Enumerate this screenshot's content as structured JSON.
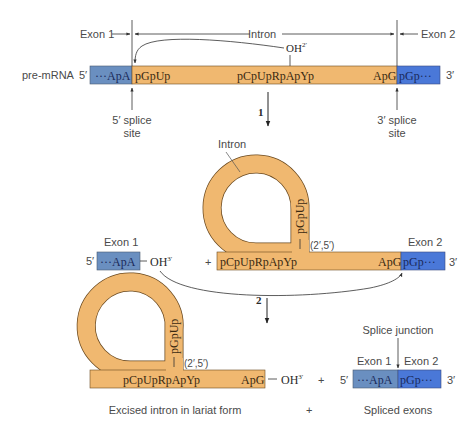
{
  "colors": {
    "intron": "#f0b870",
    "intron_stroke": "#6b4a20",
    "exon1": "#6a8fc0",
    "exon2": "#4a78d8",
    "line": "#333333",
    "label": "#4a4a4a"
  },
  "premrna": {
    "label": "pre-mRNA",
    "five_prime": "5′",
    "three_prime": "3′",
    "exon1_seq": "···ApA",
    "intron_start": "pGpUp",
    "intron_branch": "pCpUpRpApYp",
    "intron_end": "ApG",
    "exon2_seq": "pGp···",
    "branch_oh": "OH",
    "branch_oh_sup": "2′"
  },
  "top_labels": {
    "exon1": "Exon 1",
    "intron": "Intron",
    "exon2": "Exon 2"
  },
  "splice_sites": {
    "five_line1": "5′ splice",
    "five_line2": "site",
    "three_line1": "3′ splice",
    "three_line2": "site"
  },
  "steps": {
    "step1": "1",
    "step2": "2"
  },
  "intermediate": {
    "intron_label": "Intron",
    "exon1_label": "Exon 1",
    "exon1_five": "5′",
    "exon1_seq": "···ApA",
    "exon1_oh": "OH",
    "exon1_oh_sup": "3′",
    "plus": "+",
    "loop_seq": "pGpUp",
    "branch_seq": "pCpUpRpApYp",
    "linkage": "(2′,5′)",
    "intron_end": "ApG",
    "exon2_label": "Exon 2",
    "exon2_seq": "pGp···",
    "three_prime": "3′"
  },
  "products": {
    "loop_seq": "pGpUp",
    "branch_seq": "pCpUpRpApYp",
    "linkage": "(2′,5′)",
    "intron_end": "ApG",
    "oh": "OH",
    "oh_sup": "3′",
    "plus": "+",
    "junction_label": "Splice junction",
    "exon1_label": "Exon 1",
    "exon2_label": "Exon 2",
    "five_prime": "5′",
    "exon1_seq": "···ApA",
    "exon2_seq": "pGp···",
    "three_prime": "3′",
    "caption_lariat": "Excised intron in lariat form",
    "caption_plus": "+",
    "caption_exons": "Spliced exons"
  }
}
